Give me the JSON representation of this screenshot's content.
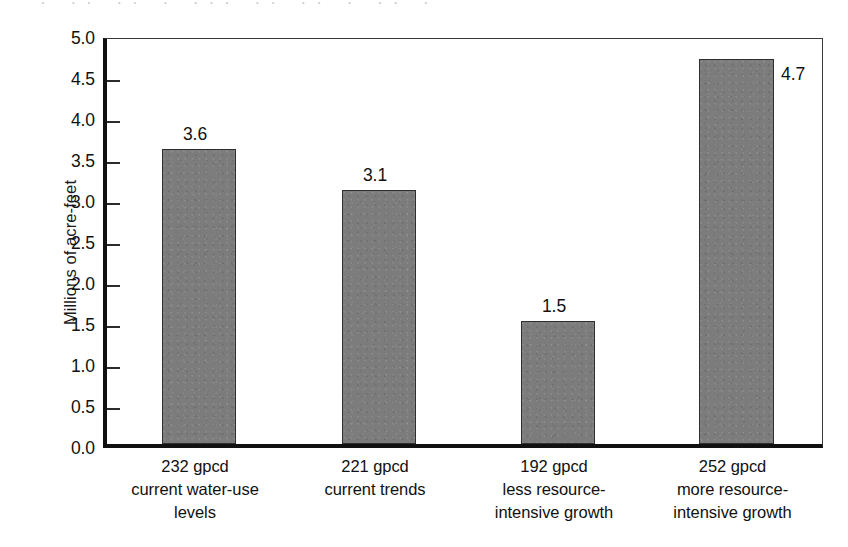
{
  "figure": {
    "scan_artifact_text": "· ·· ·· · ··· ·· ·· · ·· ·",
    "bar_color": "#7c7c7c",
    "bar_edge_color": "#2f2f2f",
    "axis_color": "#111111",
    "background_color": "#ffffff"
  },
  "chart_data": {
    "type": "bar",
    "title": "",
    "subtitle": "",
    "xlabel": "",
    "ylabel": "Millions of acre-feet",
    "ylim": [
      0.0,
      5.0
    ],
    "ytick_values": [
      0.0,
      0.5,
      1.0,
      1.5,
      2.0,
      2.5,
      3.0,
      3.5,
      4.0,
      4.5,
      5.0
    ],
    "ytick_labels": [
      "0.0",
      "0.5",
      "1.0",
      "1.5",
      "2.0",
      "2.5",
      "3.0",
      "3.5",
      "4.0",
      "4.5",
      "5.0"
    ],
    "grid": false,
    "legend": null,
    "categories": [
      "232 gpcd current water-use levels",
      "221 gpcd current trends",
      "192 gpcd less resource-intensive growth",
      "252 gpcd more resource-intensive growth"
    ],
    "category_label_lines": [
      [
        "232 gpcd",
        "current water-use",
        "levels"
      ],
      [
        "221 gpcd",
        "current trends"
      ],
      [
        "192 gpcd",
        "less resource-",
        "intensive growth"
      ],
      [
        "252 gpcd",
        "more resource-",
        "intensive growth"
      ]
    ],
    "values": [
      3.6,
      3.1,
      1.5,
      4.7
    ],
    "data_labels": [
      "3.6",
      "3.1",
      "1.5",
      "4.7"
    ],
    "data_label_positions": [
      "above",
      "above",
      "above",
      "right"
    ]
  }
}
